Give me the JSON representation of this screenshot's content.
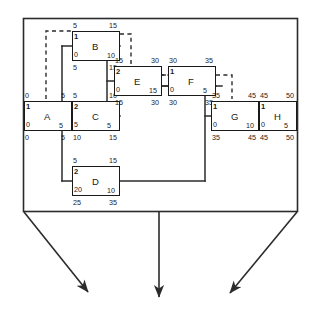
{
  "diagram": {
    "type": "activity-on-node-network",
    "outer_frame": {
      "name": "outer-boundary-box",
      "stroke": "#2b2b2b"
    },
    "nodes": [
      {
        "id": "A",
        "name": "A",
        "top_left": "0",
        "top_right": "5",
        "inner_top_left": "1",
        "inner_bottom_left": "0",
        "inner_bottom_right": "5",
        "bottom_left": "0",
        "bottom_right": "5",
        "x": 24,
        "y": 101,
        "w": 48,
        "h": 30
      },
      {
        "id": "B",
        "name": "B",
        "top_left": "5",
        "top_right": "15",
        "inner_top_left": "1",
        "inner_bottom_left": "0",
        "inner_bottom_right": "10",
        "bottom_left": "5",
        "bottom_right": "15",
        "x": 72,
        "y": 31,
        "w": 48,
        "h": 30
      },
      {
        "id": "C",
        "name": "C",
        "top_left": "5",
        "top_right": "10",
        "inner_top_left": "2",
        "inner_bottom_left": "5",
        "inner_bottom_right": "5",
        "bottom_left": "10",
        "bottom_right": "15",
        "x": 72,
        "y": 101,
        "w": 48,
        "h": 30
      },
      {
        "id": "D",
        "name": "D",
        "top_left": "5",
        "top_right": "15",
        "inner_top_left": "2",
        "inner_bottom_left": "20",
        "inner_bottom_right": "10",
        "bottom_left": "25",
        "bottom_right": "35",
        "x": 72,
        "y": 166,
        "w": 48,
        "h": 30
      },
      {
        "id": "E",
        "name": "E",
        "top_left": "15",
        "top_right": "30",
        "inner_top_left": "2",
        "inner_bottom_left": "0",
        "inner_bottom_right": "15",
        "bottom_left": "15",
        "bottom_right": "30",
        "x": 114,
        "y": 66,
        "w": 48,
        "h": 30
      },
      {
        "id": "F",
        "name": "F",
        "top_left": "30",
        "top_right": "35",
        "inner_top_left": "1",
        "inner_bottom_left": "0",
        "inner_bottom_right": "5",
        "bottom_left": "30",
        "bottom_right": "35",
        "x": 168,
        "y": 66,
        "w": 48,
        "h": 30
      },
      {
        "id": "G",
        "name": "G",
        "top_left": "35",
        "top_right": "45",
        "inner_top_left": "1",
        "inner_bottom_left": "0",
        "inner_bottom_right": "10",
        "bottom_left": "35",
        "bottom_right": "45",
        "x": 211,
        "y": 101,
        "w": 48,
        "h": 30
      },
      {
        "id": "H",
        "name": "H",
        "top_left": "45",
        "top_right": "50",
        "inner_top_left": "1",
        "inner_bottom_left": "0",
        "inner_bottom_right": "5",
        "bottom_left": "45",
        "bottom_right": "50",
        "x": 259,
        "y": 101,
        "w": 38,
        "h": 30
      }
    ],
    "solid_links": [
      {
        "from": "A",
        "to": "B"
      },
      {
        "from": "A",
        "to": "C"
      },
      {
        "from": "A",
        "to": "D"
      },
      {
        "from": "B",
        "to": "E"
      },
      {
        "from": "C",
        "to": "E"
      },
      {
        "from": "E",
        "to": "F"
      },
      {
        "from": "F",
        "to": "G"
      },
      {
        "from": "D",
        "to": "G"
      },
      {
        "from": "G",
        "to": "H"
      }
    ],
    "dashed_links": [
      {
        "from": "A",
        "to": "B",
        "style": "dashed"
      },
      {
        "from": "B",
        "to": "E",
        "style": "dashed"
      },
      {
        "from": "E",
        "to": "F",
        "style": "dashed"
      },
      {
        "from": "F",
        "to": "G",
        "style": "dashed"
      },
      {
        "from": "G",
        "to": "H",
        "style": "dashed"
      }
    ],
    "callout_arrows": [
      {
        "name": "callout-arrow-left",
        "direction": "down-right"
      },
      {
        "name": "callout-arrow-center",
        "direction": "down"
      },
      {
        "name": "callout-arrow-right",
        "direction": "down-left"
      }
    ],
    "colors": {
      "line": "#2b2b2b",
      "node_border": "#1a1a1a",
      "text": "#1a1a1a",
      "background": "#ffffff"
    }
  }
}
